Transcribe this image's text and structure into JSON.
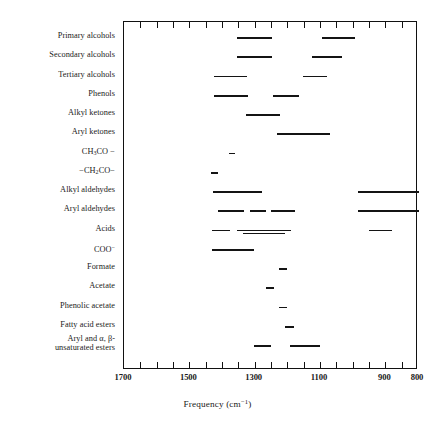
{
  "chart_data": {
    "type": "bar",
    "chart_style": "range-band / characteristic-absorption chart",
    "title": "",
    "xlabel": "Frequency (cm⁻¹)",
    "ylabel": "",
    "xlim": [
      1700,
      800
    ],
    "x_axis_inverted": true,
    "xticks": [
      1700,
      1500,
      1300,
      1100,
      900,
      800
    ],
    "xticklabels": [
      "1700",
      "1500",
      "1300",
      "1100",
      "900",
      "800"
    ],
    "minor_tick_interval": 50,
    "grid": false,
    "legend": null,
    "units": "cm^-1",
    "categories": [
      "Primary alcohols",
      "Secondary alcohols",
      "Tertiary alcohols",
      "Phenols",
      "Alkyl ketones",
      "Aryl ketones",
      "CH3CO-",
      "-CH2CO-",
      "Alkyl aldehydes",
      "Aryl aldehydes",
      "Acids",
      "COO-",
      "Formate",
      "Acetate",
      "Phenolic acetate",
      "Fatty acid esters",
      "Aryl and alpha,beta-unsaturated esters"
    ],
    "rows": [
      {
        "label": "Primary alcohols",
        "bands": [
          {
            "from": 1352,
            "to": 1245
          },
          {
            "from": 1090,
            "to": 990
          }
        ]
      },
      {
        "label": "Secondary alcohols",
        "bands": [
          {
            "from": 1352,
            "to": 1245
          },
          {
            "from": 1122,
            "to": 1030
          }
        ]
      },
      {
        "label": "Tertiary alcohols",
        "bands": [
          {
            "from": 1420,
            "to": 1320
          },
          {
            "from": 1148,
            "to": 1075
          }
        ]
      },
      {
        "label": "Phenols",
        "bands": [
          {
            "from": 1420,
            "to": 1318
          },
          {
            "from": 1242,
            "to": 1160
          }
        ]
      },
      {
        "label": "Alkyl ketones",
        "bands": [
          {
            "from": 1322,
            "to": 1218
          }
        ]
      },
      {
        "label": "Aryl ketones",
        "bands": [
          {
            "from": 1228,
            "to": 1065
          }
        ]
      },
      {
        "label": "CH3CO-",
        "bands": [
          {
            "from": 1375,
            "to": 1358
          }
        ]
      },
      {
        "label": "-CH2CO-",
        "bands": [
          {
            "from": 1430,
            "to": 1408
          }
        ]
      },
      {
        "label": "Alkyl aldehydes",
        "bands": [
          {
            "from": 1425,
            "to": 1275
          },
          {
            "from": 982,
            "to": 795
          }
        ]
      },
      {
        "label": "Aryl aldehydes",
        "bands": [
          {
            "from": 1408,
            "to": 1330
          },
          {
            "from": 1312,
            "to": 1262
          },
          {
            "from": 1248,
            "to": 1172
          },
          {
            "from": 982,
            "to": 795
          }
        ]
      },
      {
        "label": "Acids",
        "bands": [
          {
            "from": 1428,
            "to": 1372
          },
          {
            "from": 1352,
            "to": 1185
          },
          {
            "from": 1332,
            "to": 1205
          },
          {
            "from": 948,
            "to": 878
          }
        ]
      },
      {
        "label": "COO-",
        "bands": [
          {
            "from": 1428,
            "to": 1298
          }
        ]
      },
      {
        "label": "Formate",
        "bands": [
          {
            "from": 1222,
            "to": 1198
          }
        ]
      },
      {
        "label": "Acetate",
        "bands": [
          {
            "from": 1262,
            "to": 1238
          }
        ]
      },
      {
        "label": "Phenolic acetate",
        "bands": [
          {
            "from": 1222,
            "to": 1198
          }
        ]
      },
      {
        "label": "Fatty acid esters",
        "bands": [
          {
            "from": 1205,
            "to": 1175
          }
        ]
      },
      {
        "label": "Aryl and alpha,beta-unsaturated esters",
        "bands": [
          {
            "from": 1300,
            "to": 1248
          },
          {
            "from": 1188,
            "to": 1098
          }
        ]
      }
    ]
  },
  "axis": {
    "title": "Frequency (cm",
    "title_sup": "−1",
    "title_close": ")",
    "tick_labels": [
      "1700",
      "1500",
      "1300",
      "1100",
      "900",
      "800"
    ]
  },
  "row_labels": [
    {
      "text": "Primary alcohols",
      "kind": "plain"
    },
    {
      "text": "Secondary alcohols",
      "kind": "plain"
    },
    {
      "text": "Tertiary alcohols",
      "kind": "plain"
    },
    {
      "text": "Phenols",
      "kind": "plain"
    },
    {
      "text": "Alkyl ketones",
      "kind": "plain"
    },
    {
      "text": "Aryl ketones",
      "kind": "plain"
    },
    {
      "text": "CH3CO —",
      "kind": "formula-ch3co"
    },
    {
      "text": "— CH2CO —",
      "kind": "formula-ch2co"
    },
    {
      "text": "Alkyl aldehydes",
      "kind": "plain"
    },
    {
      "text": "Aryl aldehydes",
      "kind": "plain"
    },
    {
      "text": "Acids",
      "kind": "plain"
    },
    {
      "text": "COO⁻",
      "kind": "formula-coo"
    },
    {
      "text": "Formate",
      "kind": "plain"
    },
    {
      "text": "Acetate",
      "kind": "plain"
    },
    {
      "text": "Phenolic acetate",
      "kind": "plain"
    },
    {
      "text": "Fatty acid esters",
      "kind": "plain"
    },
    {
      "text": "Aryl and α, β-unsaturated esters",
      "kind": "two-line"
    }
  ],
  "row_label_parts": {
    "ch3co_lead": "CH",
    "ch3co_sub": "3",
    "ch3co_tail": "CO −",
    "ch2co_lead": "−CH",
    "ch2co_sub": "2",
    "ch2co_tail": "CO−",
    "coo_lead": "COO",
    "coo_sup": "−",
    "last_line1": "Aryl and α, β-",
    "last_line2": "unsaturated esters"
  },
  "colors": {
    "bar": "#141414",
    "frame": "#111111",
    "text": "#1a1a1a",
    "background": "#ffffff"
  }
}
